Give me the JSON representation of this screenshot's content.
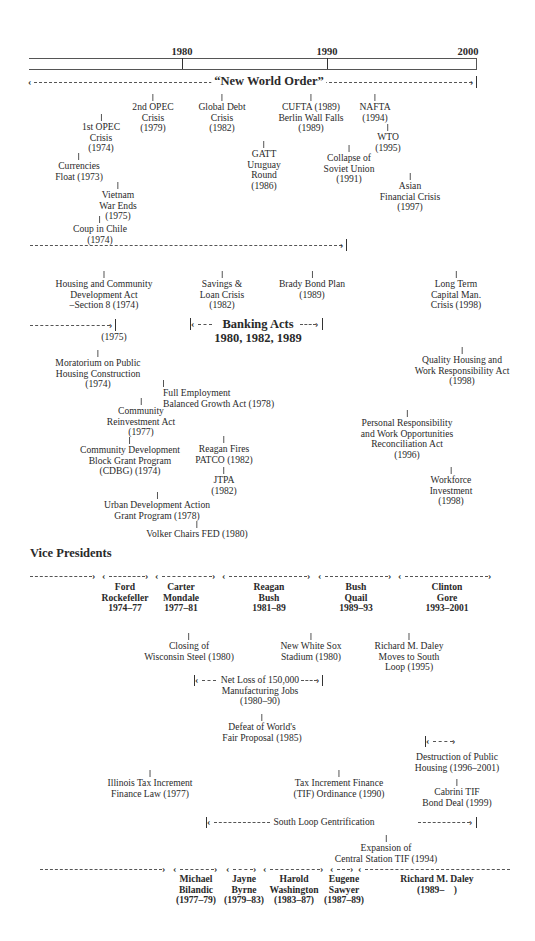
{
  "axis": {
    "years": [
      {
        "label": "1980",
        "x": 182
      },
      {
        "label": "1990",
        "x": 327
      },
      {
        "label": "2000",
        "x": 476
      }
    ]
  },
  "global": {
    "banner": "“New World Order”",
    "events": [
      {
        "text": "2nd OPEC\nCrisis\n(1979)",
        "x": 153,
        "y": 94
      },
      {
        "text": "Global Debt\nCrisis\n(1982)",
        "x": 222,
        "y": 94
      },
      {
        "text": "CUFTA (1989)\nBerlin Wall Falls\n(1989)",
        "x": 311,
        "y": 94
      },
      {
        "text": "NAFTA\n(1994)",
        "x": 375,
        "y": 94
      },
      {
        "text": "1st OPEC\nCrisis\n(1974)",
        "x": 101,
        "y": 114
      },
      {
        "text": "WTO\n(1995)",
        "x": 388,
        "y": 124
      },
      {
        "text": "GATT\nUruguay\nRound\n(1986)",
        "x": 264,
        "y": 141
      },
      {
        "text": "Collapse of\nSoviet Union\n(1991)",
        "x": 349,
        "y": 145
      },
      {
        "text": "Currencies\nFloat (1973)",
        "x": 79,
        "y": 153
      },
      {
        "text": "Asian\nFinancial Crisis\n(1997)",
        "x": 410,
        "y": 173
      },
      {
        "text": "Vietnam\nWar Ends\n(1975)",
        "x": 118,
        "y": 182
      },
      {
        "text": "Coup in Chile\n(1974)",
        "x": 100,
        "y": 216
      }
    ]
  },
  "policy": {
    "banking_acts": "Banking Acts\n1980, 1982, 1989",
    "events": [
      {
        "text": "Housing and Community\nDevelopment Act\n–Section 8 (1974)",
        "x": 104,
        "y": 271
      },
      {
        "text": "Savings &\nLoan Crisis\n(1982)",
        "x": 222,
        "y": 271
      },
      {
        "text": "Brady Bond Plan\n(1989)",
        "x": 312,
        "y": 271
      },
      {
        "text": "Long Term\nCapital Man.\nCrisis (1998)",
        "x": 456,
        "y": 271
      },
      {
        "text": "(1975)",
        "x": 114,
        "y": 332,
        "notick": true
      },
      {
        "text": "Moratorium on Public\nHousing Construction\n(1974)",
        "x": 98,
        "y": 350
      },
      {
        "text": "Quality Housing and\nWork Responsibility Act\n(1998)",
        "x": 462,
        "y": 347
      },
      {
        "text": "Full Employment\nBalanced Growth Act (1978)",
        "x": 163,
        "y": 380,
        "left": true
      },
      {
        "text": "Community\nReinvestment Act\n(1977)",
        "x": 141,
        "y": 398
      },
      {
        "text": "Personal Responsibility\nand Work Opportunities\nReconciliation Act\n(1996)",
        "x": 407,
        "y": 410
      },
      {
        "text": "Reagan Fires\nPATCO (1982)",
        "x": 224,
        "y": 436
      },
      {
        "text": "Community Development\nBlock Grant Program\n(CDBG) (1974)",
        "x": 130,
        "y": 437
      },
      {
        "text": "Workforce\nInvestment\n(1998)",
        "x": 451,
        "y": 467
      },
      {
        "text": "JTPA\n(1982)",
        "x": 224,
        "y": 467
      },
      {
        "text": "Urban Development Action\nGrant Program (1978)",
        "x": 157,
        "y": 492
      },
      {
        "text": "Volker Chairs FED (1980)",
        "x": 197,
        "y": 521
      }
    ]
  },
  "vice_presidents": {
    "title": "Vice Presidents",
    "terms": [
      {
        "text": "Ford\nRockefeller\n1974–77",
        "x": 125
      },
      {
        "text": "Carter\nMondale\n1977–81",
        "x": 181
      },
      {
        "text": "Reagan\nBush\n1981–89",
        "x": 269
      },
      {
        "text": "Bush\nQuail\n1989–93",
        "x": 356
      },
      {
        "text": "Clinton\nGore\n1993–2001",
        "x": 447
      }
    ]
  },
  "chicago": {
    "net_loss": "Net Loss of 150,000\nManufacturing Jobs\n(1980–90)",
    "south_loop": "South Loop Gentrification",
    "events": [
      {
        "text": "Closing of\nWisconsin Steel (1980)",
        "x": 189,
        "y": 633
      },
      {
        "text": "New White Sox\nStadium (1980)",
        "x": 311,
        "y": 633
      },
      {
        "text": "Richard M. Daley\nMoves to South\nLoop (1995)",
        "x": 409,
        "y": 633
      },
      {
        "text": "Defeat of World's\nFair Proposal (1985)",
        "x": 262,
        "y": 714
      },
      {
        "text": "Destruction of Public\nHousing (1996–2001)",
        "x": 457,
        "y": 752,
        "notick": true
      },
      {
        "text": "Illinois Tax Increment\nFinance Law (1977)",
        "x": 150,
        "y": 770
      },
      {
        "text": "Tax Increment Finance\n(TIF) Ordinance (1990)",
        "x": 339,
        "y": 770
      },
      {
        "text": "Cabrini TIF\nBond Deal (1999)",
        "x": 457,
        "y": 779
      },
      {
        "text": "Expansion of\nCentral Station TIF (1994)",
        "x": 386,
        "y": 835
      }
    ]
  },
  "mayors": {
    "terms": [
      {
        "text": "Michael\nBilandic\n(1977–79)",
        "x": 196
      },
      {
        "text": "Jayne\nByrne\n(1979–83)",
        "x": 244
      },
      {
        "text": "Harold\nWashington\n(1983–87)",
        "x": 294
      },
      {
        "text": "Eugene\nSawyer\n(1987–89)",
        "x": 344
      },
      {
        "text": "Richard M. Daley\n(1989–    )",
        "x": 437
      }
    ]
  }
}
